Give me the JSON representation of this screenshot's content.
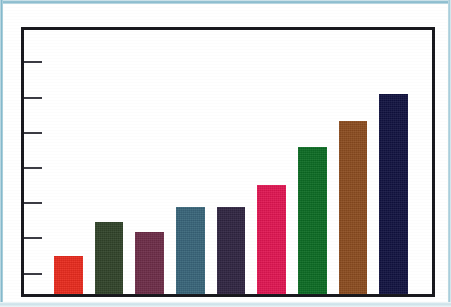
{
  "chart_data": {
    "type": "bar",
    "title": "",
    "subtitle": "",
    "xlabel": "",
    "ylabel": "",
    "grid": false,
    "legend": "none",
    "axis_tick_labels_visible": false,
    "y_axis_tick_count": 7,
    "ylim": [
      0,
      7
    ],
    "categories": [
      "1",
      "2",
      "3",
      "4",
      "5",
      "6",
      "7",
      "8",
      "9"
    ],
    "values": [
      1.0,
      1.9,
      1.65,
      2.3,
      2.3,
      2.9,
      3.9,
      4.6,
      5.3
    ],
    "series": [
      {
        "name": "Series 1",
        "values": [
          1.0,
          1.9,
          1.65,
          2.3,
          2.3,
          2.9,
          3.9,
          4.6,
          5.3
        ]
      }
    ],
    "bar_colors": [
      "#e8291c",
      "#2f4228",
      "#6b2b46",
      "#376378",
      "#2e2340",
      "#e01451",
      "#0a6a22",
      "#8a4a1e",
      "#10113f"
    ],
    "bar_color_names": [
      "red",
      "dark-olive-green",
      "wine-purple",
      "steel-blue",
      "dark-violet",
      "crimson-pink",
      "forest-green",
      "brown",
      "navy"
    ]
  },
  "frame": {
    "border_color": "#17171c",
    "background_color": "#ffffff",
    "tick_color": "#3a3a42"
  },
  "page": {
    "edge_color": "#9ec9d8",
    "background_color": "#fdfdfb"
  }
}
